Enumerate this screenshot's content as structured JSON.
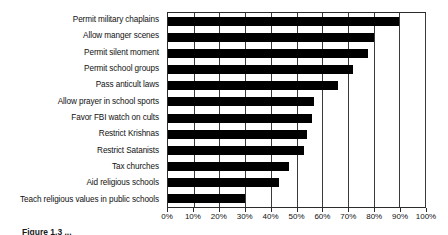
{
  "chart_data": {
    "type": "bar",
    "orientation": "horizontal",
    "title": "",
    "subtitle": "",
    "xlabel": "",
    "ylabel": "",
    "xlim": [
      0,
      100
    ],
    "grid": true,
    "legend": false,
    "legend_position": "none",
    "bar_color": "#000000",
    "background_color": "#ffffff",
    "axis_color": "#2b2b2b",
    "categories": [
      "Permit military chaplains",
      "Allow manger scenes",
      "Permit silent moment",
      "Permit school groups",
      "Pass anticult laws",
      "Allow prayer in school sports",
      "Favor FBI watch on cults",
      "Restrict Krishnas",
      "Restrict Satanists",
      "Tax churches",
      "Aid religious schools",
      "Teach religious values in public schools"
    ],
    "values": [
      90,
      80,
      78,
      72,
      66,
      57,
      56,
      54,
      53,
      47,
      43,
      30
    ],
    "tick_values": [
      0,
      10,
      20,
      30,
      40,
      50,
      60,
      70,
      80,
      90,
      100
    ],
    "tick_labels": [
      "0%",
      "10%",
      "20%",
      "30%",
      "40%",
      "50%",
      "60%",
      "70%",
      "80%",
      "90%",
      "100%"
    ]
  },
  "caption": {
    "text": "Figure 1.3 ..."
  }
}
